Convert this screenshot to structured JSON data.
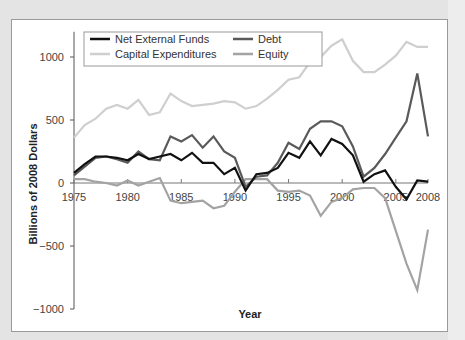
{
  "chart_data": {
    "type": "line",
    "title": "",
    "xlabel": "Year",
    "ylabel": "Billions of 2008 Dollars",
    "ylim": [
      -1000,
      1200
    ],
    "xlim": [
      1975,
      2008
    ],
    "yticks": [
      1000,
      500,
      0,
      -500,
      -1000
    ],
    "ytick_labels": [
      "1000",
      "500",
      "0",
      "−500",
      "−1000"
    ],
    "xticks": [
      1975,
      1980,
      1985,
      1990,
      1995,
      2000,
      2005,
      2008
    ],
    "xtick_labels": [
      "1975",
      "1980",
      "1985",
      "1990",
      "1995",
      "2000",
      "2005",
      "2008"
    ],
    "grid": false,
    "legend_position": "top-left (inside plot)",
    "x": [
      1975,
      1976,
      1977,
      1978,
      1979,
      1980,
      1981,
      1982,
      1983,
      1984,
      1985,
      1986,
      1987,
      1988,
      1989,
      1990,
      1991,
      1992,
      1993,
      1994,
      1995,
      1996,
      1997,
      1998,
      1999,
      2000,
      2001,
      2002,
      2003,
      2004,
      2005,
      2006,
      2007,
      2008
    ],
    "series": [
      {
        "name": "Net External Funds",
        "color": "#111111",
        "width": 2.2,
        "values": [
          80,
          150,
          210,
          210,
          200,
          180,
          230,
          190,
          210,
          230,
          180,
          240,
          160,
          160,
          70,
          120,
          -60,
          70,
          80,
          120,
          240,
          200,
          330,
          220,
          350,
          310,
          220,
          10,
          70,
          100,
          -30,
          -130,
          20,
          10
        ]
      },
      {
        "name": "Debt",
        "color": "#5a5a5a",
        "width": 2.2,
        "values": [
          60,
          130,
          200,
          210,
          190,
          160,
          250,
          190,
          180,
          370,
          330,
          380,
          280,
          370,
          250,
          200,
          -30,
          50,
          60,
          160,
          320,
          270,
          430,
          490,
          490,
          450,
          290,
          50,
          120,
          230,
          360,
          490,
          870,
          370
        ]
      },
      {
        "name": "Capital Expenditures",
        "color": "#cfcfcf",
        "width": 2.2,
        "values": [
          360,
          460,
          510,
          590,
          620,
          590,
          660,
          540,
          560,
          710,
          650,
          610,
          620,
          630,
          650,
          640,
          590,
          610,
          670,
          740,
          820,
          840,
          960,
          1000,
          1090,
          1140,
          970,
          880,
          880,
          940,
          1010,
          1120,
          1080,
          1080
        ]
      },
      {
        "name": "Equity",
        "color": "#a3a3a3",
        "width": 2.2,
        "values": [
          30,
          30,
          10,
          0,
          -20,
          20,
          -20,
          10,
          40,
          -140,
          -160,
          -150,
          -140,
          -200,
          -180,
          -70,
          30,
          30,
          30,
          -60,
          -70,
          -60,
          -100,
          -260,
          -150,
          -120,
          -50,
          -40,
          -40,
          -120,
          -380,
          -640,
          -850,
          -370
        ]
      }
    ],
    "legend": [
      {
        "label": "Net External Funds",
        "color": "#111111"
      },
      {
        "label": "Debt",
        "color": "#5a5a5a"
      },
      {
        "label": "Capital Expenditures",
        "color": "#cfcfcf"
      },
      {
        "label": "Equity",
        "color": "#a3a3a3"
      }
    ]
  }
}
